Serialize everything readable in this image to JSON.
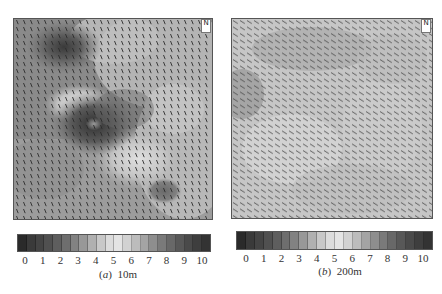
{
  "figure": {
    "panels": [
      {
        "id": "a",
        "caption_prefix": "(",
        "caption_letter": "a",
        "caption_suffix": ")",
        "caption_height": "10m",
        "north_marker": "N",
        "colorbar_ticks": [
          "0",
          "1",
          "2",
          "3",
          "4",
          "5",
          "6",
          "7",
          "8",
          "9",
          "10"
        ]
      },
      {
        "id": "b",
        "caption_prefix": "(",
        "caption_letter": "b",
        "caption_suffix": ")",
        "caption_height": "200m",
        "north_marker": "N",
        "colorbar_ticks": [
          "0",
          "1",
          "2",
          "3",
          "4",
          "5",
          "6",
          "7",
          "8",
          "9",
          "10"
        ]
      }
    ],
    "colorbar_colors": [
      "#2a2a2a",
      "#3a3a3a",
      "#444444",
      "#505050",
      "#5e5e5e",
      "#6e6e6e",
      "#828282",
      "#989898",
      "#b0b0b0",
      "#c8c8c8",
      "#dcdcdc",
      "#e4e4e4",
      "#d2d2d2",
      "#bcbcbc",
      "#a4a4a4",
      "#8e8e8e",
      "#7a7a7a",
      "#686868",
      "#585858",
      "#4a4a4a",
      "#3e3e3e",
      "#333333"
    ]
  }
}
